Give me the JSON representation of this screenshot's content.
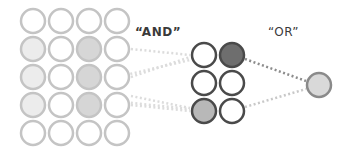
{
  "labels": {
    "and": "“AND”",
    "or": "“OR”"
  },
  "colors": {
    "grid_stroke": "#c4c4c4",
    "grid_fill_light": "#ececec",
    "grid_fill_medium": "#d6d6d6",
    "mid_stroke": "#4a4a4a",
    "mid_fill_dark": "#6e6e6e",
    "mid_fill_medium": "#b8b8b8",
    "output_stroke": "#8a8a8a",
    "output_fill": "#d9d9d9",
    "line_faint": "#dcdcdc",
    "line_dark": "#8c8c8c",
    "line_light": "#c8c8c8"
  },
  "input_grid": {
    "rows": 5,
    "cols": 4,
    "cells": [
      [
        "empty",
        "empty",
        "empty",
        "empty"
      ],
      [
        "light",
        "empty",
        "medium",
        "empty"
      ],
      [
        "light",
        "empty",
        "medium",
        "empty"
      ],
      [
        "light",
        "empty",
        "medium",
        "empty"
      ],
      [
        "empty",
        "empty",
        "empty",
        "empty"
      ]
    ]
  },
  "and_layer": {
    "rows": 3,
    "cols": 2,
    "cells": [
      [
        "empty",
        "dark"
      ],
      [
        "empty",
        "empty"
      ],
      [
        "medium",
        "empty"
      ]
    ]
  },
  "or_output": {
    "state": "light"
  }
}
